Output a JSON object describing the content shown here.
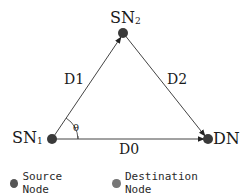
{
  "diagram": {
    "nodes": [
      {
        "id": "SN1",
        "label": "SN",
        "subscript": "1",
        "type": "source"
      },
      {
        "id": "SN2",
        "label": "SN",
        "subscript": "2",
        "type": "source"
      },
      {
        "id": "DN",
        "label": "DN",
        "subscript": "",
        "type": "destination"
      }
    ],
    "edges": [
      {
        "from": "SN1",
        "to": "SN2",
        "label": "D1"
      },
      {
        "from": "SN2",
        "to": "DN",
        "label": "D2"
      },
      {
        "from": "SN1",
        "to": "DN",
        "label": "D0"
      }
    ],
    "angle_label": "θ"
  },
  "legend": {
    "items": [
      {
        "label": "Source Node",
        "color": "#555555"
      },
      {
        "label": "Destination Node",
        "color": "#777777"
      }
    ]
  },
  "colors": {
    "node_fill": "#3a3a3a",
    "edge_stroke": "#444444"
  }
}
